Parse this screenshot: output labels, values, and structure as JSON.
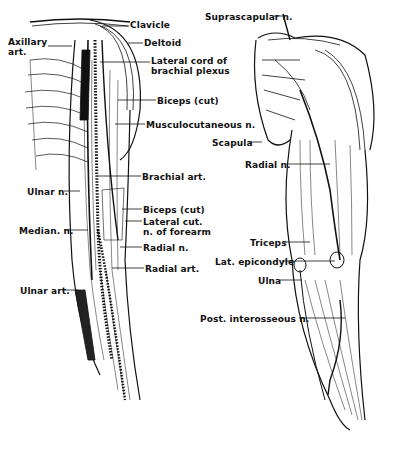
{
  "figure": {
    "left_view": {
      "description": "Anterior arm - nerves and arteries",
      "labels": [
        {
          "id": "clavicle",
          "text": "Clavicle",
          "x": 130,
          "y": 20
        },
        {
          "id": "axillary",
          "text": "Axillary\nart.",
          "x": 8,
          "y": 37
        },
        {
          "id": "deltoid",
          "text": "Deltoid",
          "x": 144,
          "y": 38
        },
        {
          "id": "lateral-cord",
          "text": "Lateral cord of\nbrachial plexus",
          "x": 151,
          "y": 56
        },
        {
          "id": "biceps-cut-upper",
          "text": "Biceps (cut)",
          "x": 157,
          "y": 96
        },
        {
          "id": "musculocutaneous",
          "text": "Musculocutaneous n.",
          "x": 146,
          "y": 120
        },
        {
          "id": "brachial-art",
          "text": "Brachial art.",
          "x": 142,
          "y": 172
        },
        {
          "id": "ulnar-n",
          "text": "Ulnar n.",
          "x": 27,
          "y": 187
        },
        {
          "id": "biceps-cut-lower",
          "text": "Biceps (cut)",
          "x": 143,
          "y": 205
        },
        {
          "id": "lateral-cut",
          "text": "Lateral cut.\nn. of forearm",
          "x": 143,
          "y": 217
        },
        {
          "id": "median",
          "text": "Median. n.",
          "x": 19,
          "y": 226
        },
        {
          "id": "radial-n-left",
          "text": "Radial n.",
          "x": 143,
          "y": 243
        },
        {
          "id": "radial-art",
          "text": "Radial art.",
          "x": 145,
          "y": 264
        },
        {
          "id": "ulnar-art",
          "text": "Ulnar art.",
          "x": 20,
          "y": 286
        }
      ]
    },
    "right_view": {
      "description": "Posterior arm - radial nerve course",
      "labels": [
        {
          "id": "suprascapular",
          "text": "Suprascapular n.",
          "x": 247,
          "y": 12
        },
        {
          "id": "scapula",
          "text": "Scapula",
          "x": 212,
          "y": 138
        },
        {
          "id": "radial-n-right",
          "text": "Radial n.",
          "x": 245,
          "y": 160
        },
        {
          "id": "triceps",
          "text": "Triceps",
          "x": 250,
          "y": 238
        },
        {
          "id": "lat-epicondyle",
          "text": "Lat. epicondyle",
          "x": 215,
          "y": 257
        },
        {
          "id": "ulna",
          "text": "Ulna",
          "x": 258,
          "y": 276
        },
        {
          "id": "post-interosseous",
          "text": "Post. interosseous n.",
          "x": 206,
          "y": 314
        }
      ]
    }
  }
}
